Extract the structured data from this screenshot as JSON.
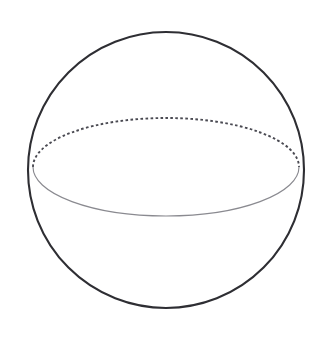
{
  "figure": {
    "kind": "geometry-diagram",
    "background_color": "#ffffff",
    "width": 324,
    "height": 339,
    "shapes": {
      "sphere_outline": {
        "name": "sphere-outline-circle",
        "center_x": 166,
        "center_y": 170,
        "radius": 138,
        "stroke_color": "#2e2e33",
        "stroke_width": 2.1,
        "fill": "none"
      },
      "equator_back": {
        "name": "equator-hidden-arc",
        "center_x": 166,
        "center_y": 167,
        "radius_x": 133,
        "radius_y": 49,
        "style": "dashed",
        "stroke_color": "#4a4a52",
        "stroke_width": 1.9,
        "dash_pattern": "2.6 2.4",
        "arc": "upper-half"
      },
      "equator_front": {
        "name": "equator-visible-arc",
        "center_x": 166,
        "center_y": 167,
        "radius_x": 133,
        "radius_y": 49,
        "style": "solid",
        "stroke_color": "#8a8a90",
        "stroke_width": 1.15,
        "arc": "lower-half"
      }
    },
    "labels": []
  }
}
